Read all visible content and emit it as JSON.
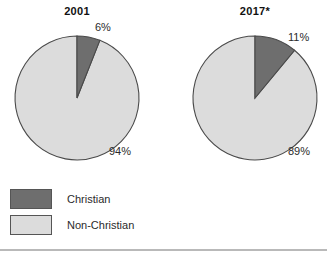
{
  "chart_data": {
    "type": "pie",
    "title": "",
    "legend_position": "bottom-left",
    "series": [
      {
        "name": "2001",
        "title": "2001",
        "categories": [
          "Christian",
          "Non-Christian"
        ],
        "values": [
          6,
          94
        ],
        "labels": [
          "6%",
          "94%"
        ]
      },
      {
        "name": "2017*",
        "title": "2017*",
        "categories": [
          "Christian",
          "Non-Christian"
        ],
        "values": [
          11,
          89
        ],
        "labels": [
          "11%",
          "89%"
        ]
      }
    ],
    "legend": [
      {
        "label": "Christian",
        "color": "#6e6e6e"
      },
      {
        "label": "Non-Christian",
        "color": "#dcdcdc"
      }
    ]
  },
  "charts": {
    "left": {
      "title": "2001",
      "dark_pct_label": "6%",
      "light_pct_label": "94%",
      "dark_value": 6,
      "light_value": 94
    },
    "right": {
      "title": "2017*",
      "dark_pct_label": "11%",
      "light_pct_label": "89%",
      "dark_value": 11,
      "light_value": 89
    }
  },
  "legend": {
    "items": [
      {
        "label": "Christian",
        "color": "#6e6e6e"
      },
      {
        "label": "Non-Christian",
        "color": "#dcdcdc"
      }
    ]
  },
  "colors": {
    "christian": "#6e6e6e",
    "non_christian": "#dcdcdc",
    "outline": "#4a4a4a",
    "rule": "#b9b9b9",
    "text": "#2b2b2b"
  }
}
